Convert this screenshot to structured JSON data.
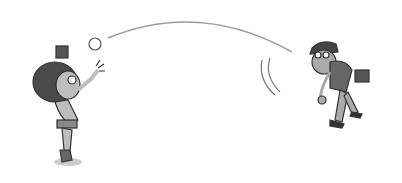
{
  "scene": {
    "description": "Cartoon of a boy catching a ball thrown by a man in a baseball cap",
    "colors": {
      "background": "#ffffff",
      "line": "#333333",
      "skin": "#bdbdbd",
      "hair": "#4a4a4a",
      "arc": "#9e9e9e"
    }
  }
}
